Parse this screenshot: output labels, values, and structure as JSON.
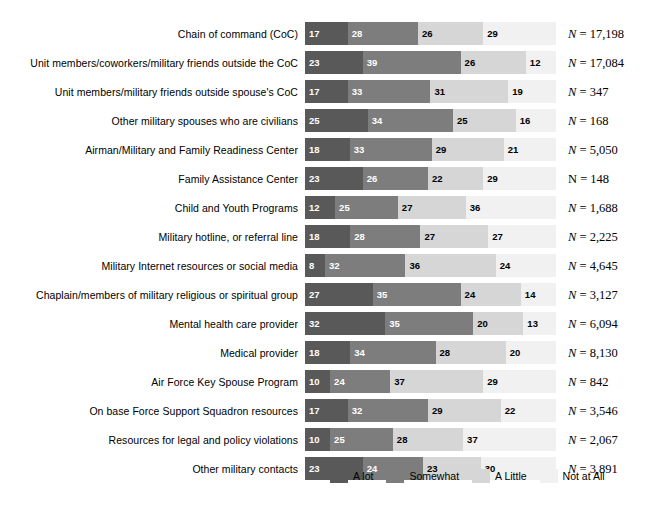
{
  "chart_data": {
    "type": "bar",
    "subtype": "stacked-horizontal-100",
    "title": "",
    "xlabel": "",
    "ylabel": "",
    "xlim": [
      0,
      100
    ],
    "grid": false,
    "legend_position": "bottom-center",
    "categories": [
      "Chain of command (CoC)",
      "Unit members/coworkers/military friends outside the CoC",
      "Unit members/military friends outside spouse's CoC",
      "Other military spouses who are civilians",
      "Airman/Military and Family Readiness Center",
      "Family Assistance Center",
      "Child and Youth Programs",
      "Military hotline, or referral line",
      "Military Internet resources or social media",
      "Chaplain/members of military religious or spiritual group",
      "Mental health care provider",
      "Medical provider",
      "Air Force Key Spouse Program",
      "On base Force Support Squadron resources",
      "Resources for legal and policy violations",
      "Other military contacts"
    ],
    "series": [
      {
        "name": "A lot",
        "color": "#595959",
        "values": [
          17,
          23,
          17,
          25,
          18,
          23,
          12,
          18,
          8,
          27,
          32,
          18,
          10,
          17,
          10,
          23
        ]
      },
      {
        "name": "Somewhat",
        "color": "#7d7d7d",
        "values": [
          28,
          39,
          33,
          34,
          33,
          26,
          25,
          28,
          32,
          35,
          35,
          34,
          24,
          32,
          25,
          24
        ]
      },
      {
        "name": "A Little",
        "color": "#d6d6d6",
        "values": [
          26,
          26,
          31,
          25,
          29,
          22,
          27,
          27,
          36,
          24,
          20,
          28,
          37,
          29,
          28,
          23
        ]
      },
      {
        "name": "Not at All",
        "color": "#f1f1f1",
        "values": [
          29,
          12,
          19,
          16,
          21,
          29,
          36,
          27,
          24,
          14,
          13,
          20,
          29,
          22,
          37,
          30
        ]
      }
    ],
    "n_labels": [
      {
        "symbol": "N",
        "italic": true,
        "text": "N = 17,198",
        "value": 17198
      },
      {
        "symbol": "N",
        "italic": true,
        "text": "N = 17,084",
        "value": 17084
      },
      {
        "symbol": "N",
        "italic": true,
        "text": "N = 347",
        "value": 347
      },
      {
        "symbol": "N",
        "italic": true,
        "text": "N = 168",
        "value": 168
      },
      {
        "symbol": "N",
        "italic": true,
        "text": "N = 5,050",
        "value": 5050
      },
      {
        "symbol": "N",
        "italic": false,
        "text": "N = 148",
        "value": 148
      },
      {
        "symbol": "N",
        "italic": true,
        "text": "N = 1,688",
        "value": 1688
      },
      {
        "symbol": "N",
        "italic": true,
        "text": "N = 2,225",
        "value": 2225
      },
      {
        "symbol": "N",
        "italic": true,
        "text": "N = 4,645",
        "value": 4645
      },
      {
        "symbol": "N",
        "italic": true,
        "text": "N = 3,127",
        "value": 3127
      },
      {
        "symbol": "N",
        "italic": true,
        "text": "N = 6,094",
        "value": 6094
      },
      {
        "symbol": "N",
        "italic": true,
        "text": "N = 8,130",
        "value": 8130
      },
      {
        "symbol": "N",
        "italic": true,
        "text": "N = 842",
        "value": 842
      },
      {
        "symbol": "N",
        "italic": true,
        "text": "N = 3,546",
        "value": 3546
      },
      {
        "symbol": "N",
        "italic": true,
        "text": "N = 2,067",
        "value": 2067
      },
      {
        "symbol": "N",
        "italic": true,
        "text": "N = 3,891",
        "value": 3891
      }
    ],
    "legend": [
      {
        "label": "A lot",
        "color": "#595959"
      },
      {
        "label": "Somewhat",
        "color": "#7d7d7d"
      },
      {
        "label": "A Little",
        "color": "#d6d6d6"
      },
      {
        "label": "Not at All",
        "color": "#f1f1f1"
      }
    ]
  }
}
